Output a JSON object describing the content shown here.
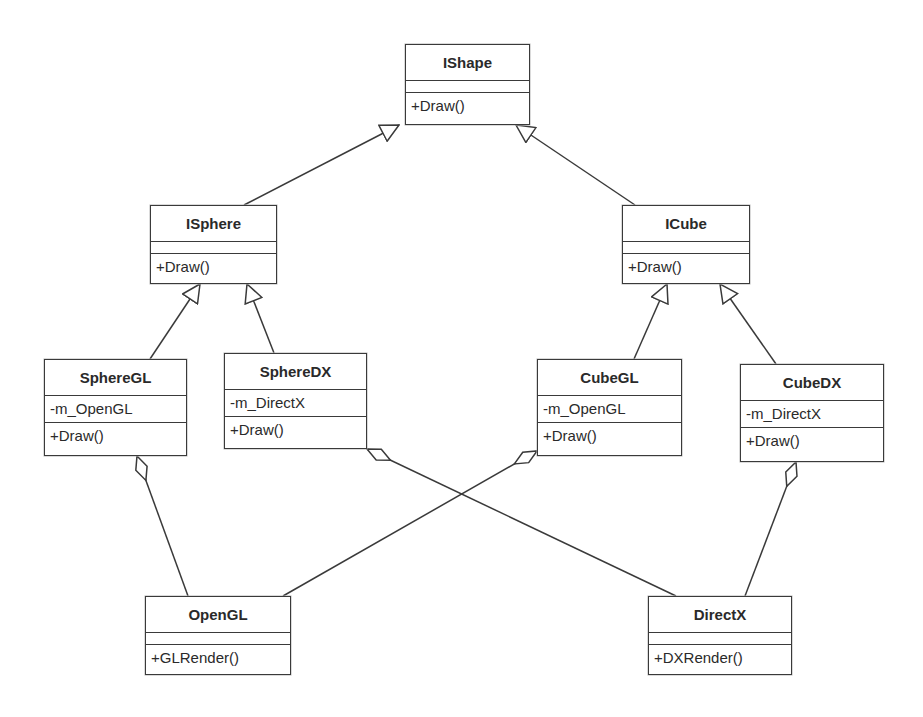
{
  "diagram": {
    "type": "UML class diagram",
    "classes": {
      "ishape": {
        "name": "IShape",
        "attributes": [],
        "operations": [
          "+Draw()"
        ]
      },
      "isphere": {
        "name": "ISphere",
        "attributes": [],
        "operations": [
          "+Draw()"
        ]
      },
      "icube": {
        "name": "ICube",
        "attributes": [],
        "operations": [
          "+Draw()"
        ]
      },
      "spheregl": {
        "name": "SphereGL",
        "attributes": [
          "-m_OpenGL"
        ],
        "operations": [
          "+Draw()"
        ]
      },
      "spheredx": {
        "name": "SphereDX",
        "attributes": [
          "-m_DirectX"
        ],
        "operations": [
          "+Draw()"
        ]
      },
      "cubegl": {
        "name": "CubeGL",
        "attributes": [
          "-m_OpenGL"
        ],
        "operations": [
          "+Draw()"
        ]
      },
      "cubedx": {
        "name": "CubeDX",
        "attributes": [
          "-m_DirectX"
        ],
        "operations": [
          "+Draw()"
        ]
      },
      "opengl": {
        "name": "OpenGL",
        "attributes": [],
        "operations": [
          "+GLRender()"
        ]
      },
      "directx": {
        "name": "DirectX",
        "attributes": [],
        "operations": [
          "+DXRender()"
        ]
      }
    },
    "relationships": [
      {
        "type": "generalization",
        "from": "ISphere",
        "to": "IShape"
      },
      {
        "type": "generalization",
        "from": "ICube",
        "to": "IShape"
      },
      {
        "type": "generalization",
        "from": "SphereGL",
        "to": "ISphere"
      },
      {
        "type": "generalization",
        "from": "SphereDX",
        "to": "ISphere"
      },
      {
        "type": "generalization",
        "from": "CubeGL",
        "to": "ICube"
      },
      {
        "type": "generalization",
        "from": "CubeDX",
        "to": "ICube"
      },
      {
        "type": "aggregation",
        "whole": "SphereGL",
        "part": "OpenGL"
      },
      {
        "type": "aggregation",
        "whole": "SphereDX",
        "part": "DirectX"
      },
      {
        "type": "aggregation",
        "whole": "CubeGL",
        "part": "OpenGL"
      },
      {
        "type": "aggregation",
        "whole": "CubeDX",
        "part": "DirectX"
      }
    ],
    "colors": {
      "line": "#3a3a3a",
      "background": "#ffffff",
      "text": "#2a2a2a"
    }
  }
}
